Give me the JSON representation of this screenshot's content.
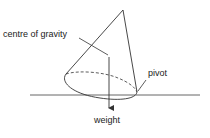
{
  "diagram": {
    "type": "physics-diagram",
    "labels": {
      "centre_of_gravity": "centre of gravity",
      "pivot": "pivot",
      "weight": "weight"
    },
    "colors": {
      "stroke": "#333333",
      "text": "#222222",
      "background": "#ffffff"
    }
  }
}
